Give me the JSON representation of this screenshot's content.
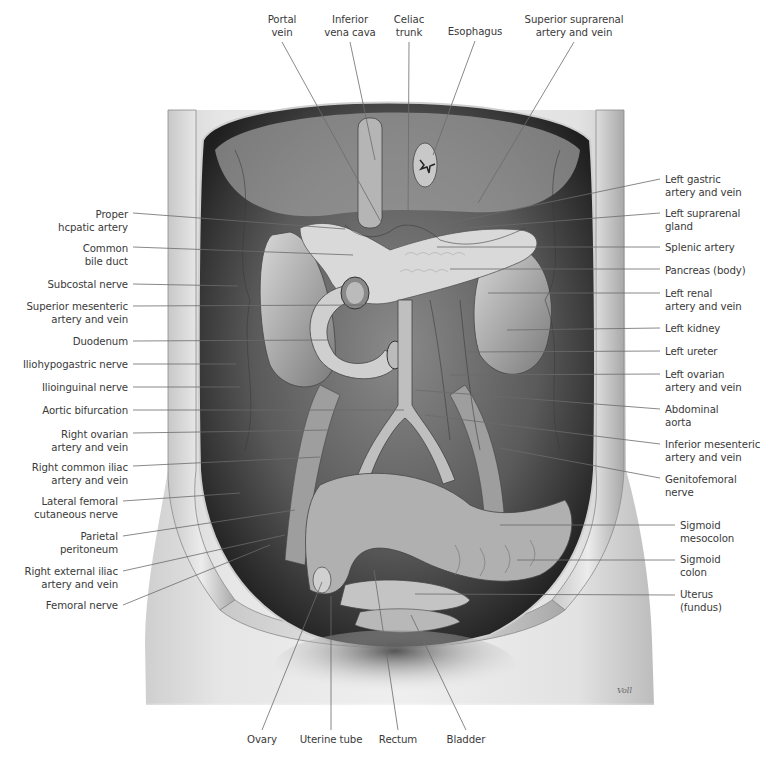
{
  "figure": {
    "type": "anatomical illustration",
    "signature": "Voll",
    "colors": {
      "background": "#ffffff",
      "label_text": "#3a3a3a",
      "leader_line": "#6b6b6b"
    }
  },
  "labels": {
    "top": [
      {
        "id": "portal-vein",
        "text": "Portal\nvein",
        "x": 282,
        "y": 13,
        "tx": 381,
        "ty": 222
      },
      {
        "id": "inferior-vena-cava",
        "text": "Inferior\nvena cava",
        "x": 350,
        "y": 13,
        "tx": 375,
        "ty": 160
      },
      {
        "id": "celiac-trunk",
        "text": "Celiac\ntrunk",
        "x": 409,
        "y": 13,
        "tx": 408,
        "ty": 228
      },
      {
        "id": "esophagus",
        "text": "Esophagus",
        "x": 475,
        "y": 25,
        "tx": 433,
        "ty": 155
      },
      {
        "id": "superior-suprarenal",
        "text": "Superior suprarenal\nartery and vein",
        "x": 574,
        "y": 13,
        "tx": 478,
        "ty": 203
      }
    ],
    "left": [
      {
        "id": "proper-hepatic-artery",
        "text": "Proper\nhcpatic artery",
        "x": 128,
        "y": 208,
        "ly": 213,
        "tx": 345,
        "ty": 229
      },
      {
        "id": "common-bile-duct",
        "text": "Common\nbile duct",
        "x": 128,
        "y": 242,
        "ly": 247,
        "tx": 353,
        "ty": 255
      },
      {
        "id": "subcostal-nerve",
        "text": "Subcostal nerve",
        "x": 128,
        "y": 278,
        "ly": 284,
        "tx": 238,
        "ty": 286
      },
      {
        "id": "superior-mesenteric",
        "text": "Superior mesenteric\nartery and vein",
        "x": 128,
        "y": 300,
        "ly": 306,
        "tx": 366,
        "ty": 305
      },
      {
        "id": "duodenum",
        "text": "Duodenum",
        "x": 128,
        "y": 335,
        "ly": 341,
        "tx": 328,
        "ty": 340
      },
      {
        "id": "iliohypogastric-nerve",
        "text": "Iliohypogastric nerve",
        "x": 128,
        "y": 358,
        "ly": 364,
        "tx": 236,
        "ty": 364
      },
      {
        "id": "ilioinguinal-nerve",
        "text": "Ilioinguinal nerve",
        "x": 128,
        "y": 381,
        "ly": 387,
        "tx": 240,
        "ty": 387
      },
      {
        "id": "aortic-bifurcation",
        "text": "Aortic bifurcation",
        "x": 128,
        "y": 404,
        "ly": 410,
        "tx": 404,
        "ty": 410
      },
      {
        "id": "right-ovarian",
        "text": "Right ovarian\nartery and vein",
        "x": 128,
        "y": 428,
        "ly": 433,
        "tx": 330,
        "ty": 430
      },
      {
        "id": "right-common-iliac",
        "text": "Right common iliac\nartery and vein",
        "x": 128,
        "y": 461,
        "ly": 466,
        "tx": 320,
        "ty": 457
      },
      {
        "id": "lateral-femoral-cutaneous",
        "text": "Lateral femoral\ncutaneous nerve",
        "x": 118,
        "y": 495,
        "ly": 501,
        "tx": 240,
        "ty": 493
      },
      {
        "id": "parietal-peritoneum",
        "text": "Parietal\nperitoneum",
        "x": 118,
        "y": 530,
        "ly": 536,
        "tx": 295,
        "ty": 510
      },
      {
        "id": "right-external-iliac",
        "text": "Right external iliac\nartery and vein",
        "x": 118,
        "y": 565,
        "ly": 571,
        "tx": 285,
        "ty": 535
      },
      {
        "id": "femoral-nerve",
        "text": "Femoral nerve",
        "x": 118,
        "y": 599,
        "ly": 605,
        "tx": 270,
        "ty": 545
      }
    ],
    "right": [
      {
        "id": "left-gastric",
        "text": "Left gastric\nartery and vein",
        "x": 665,
        "y": 173,
        "ly": 179,
        "tx": 435,
        "ty": 226
      },
      {
        "id": "left-suprarenal-gland",
        "text": "Left suprarenal\ngland",
        "x": 665,
        "y": 207,
        "ly": 213,
        "tx": 468,
        "ty": 228
      },
      {
        "id": "splenic-artery",
        "text": "Splenic artery",
        "x": 665,
        "y": 241,
        "ly": 247,
        "tx": 437,
        "ty": 247
      },
      {
        "id": "pancreas-body",
        "text": "Pancreas (body)",
        "x": 665,
        "y": 264,
        "ly": 269,
        "tx": 450,
        "ty": 269
      },
      {
        "id": "left-renal",
        "text": "Left renal\nartery and vein",
        "x": 665,
        "y": 287,
        "ly": 293,
        "tx": 488,
        "ty": 293
      },
      {
        "id": "left-kidney",
        "text": "Left kidney",
        "x": 665,
        "y": 322,
        "ly": 328,
        "tx": 507,
        "ty": 330
      },
      {
        "id": "left-ureter",
        "text": "Left ureter",
        "x": 665,
        "y": 345,
        "ly": 351,
        "tx": 465,
        "ty": 352
      },
      {
        "id": "left-ovarian",
        "text": "Left ovarian\nartery and vein",
        "x": 665,
        "y": 368,
        "ly": 374,
        "tx": 450,
        "ty": 375
      },
      {
        "id": "abdominal-aorta",
        "text": "Abdominal\naorta",
        "x": 665,
        "y": 403,
        "ly": 409,
        "tx": 415,
        "ty": 390
      },
      {
        "id": "inferior-mesenteric",
        "text": "Inferior mesenteric\nartery and vein",
        "x": 665,
        "y": 438,
        "ly": 444,
        "tx": 425,
        "ty": 415
      },
      {
        "id": "genitofemoral-nerve",
        "text": "Genitofemoral\nnerve",
        "x": 665,
        "y": 473,
        "ly": 478,
        "tx": 500,
        "ty": 448
      },
      {
        "id": "sigmoid-mesocolon",
        "text": "Sigmoid\nmesocolon",
        "x": 680,
        "y": 519,
        "ly": 525,
        "tx": 500,
        "ty": 525
      },
      {
        "id": "sigmoid-colon",
        "text": "Sigmoid\ncolon",
        "x": 680,
        "y": 553,
        "ly": 560,
        "tx": 517,
        "ty": 560
      },
      {
        "id": "uterus-fundus",
        "text": "Uterus\n(fundus)",
        "x": 680,
        "y": 588,
        "ly": 595,
        "tx": 415,
        "ty": 594
      }
    ],
    "bottom": [
      {
        "id": "ovary",
        "text": "Ovary",
        "x": 262,
        "y": 733,
        "tx": 322,
        "ty": 582
      },
      {
        "id": "uterine-tube",
        "text": "Uterine tube",
        "x": 331,
        "y": 733,
        "tx": 331,
        "ty": 596
      },
      {
        "id": "rectum",
        "text": "Rectum",
        "x": 398,
        "y": 733,
        "tx": 374,
        "ty": 570
      },
      {
        "id": "bladder",
        "text": "Bladder",
        "x": 466,
        "y": 733,
        "tx": 411,
        "ty": 615
      }
    ]
  }
}
